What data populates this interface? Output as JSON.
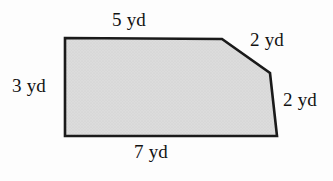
{
  "figure": {
    "name": "polygon-with-side-lengths",
    "unit": "yd",
    "fill_color": "#d6d6d6",
    "stroke_color": "#1a1a1a",
    "background_color": "#fdfdfd",
    "polygon_points": "65,38 222,39 270,73 277,136 65,136",
    "labels": {
      "top": "5 yd",
      "left": "3 yd",
      "top_right_bevel": "2 yd",
      "bottom_right_edge": "2 yd",
      "bottom": "7 yd"
    }
  }
}
